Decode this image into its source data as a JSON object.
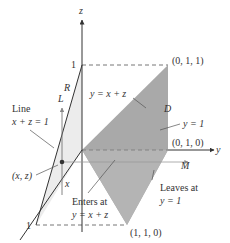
{
  "figure": {
    "type": "3d-region-diagram",
    "colors": {
      "plane_fill": "#a9a9a9",
      "face_fill": "#ececec",
      "axis": "#333333",
      "dashed": "#666666",
      "text": "#333333"
    },
    "axes": {
      "z_label": "z",
      "y_label": "y",
      "z_tick": "1",
      "x_tick": "1"
    },
    "labels": {
      "R": "R",
      "L": "L",
      "D": "D",
      "M": "M",
      "x": "x",
      "line_title": "Line",
      "line_eq": "x + z = 1",
      "plane_eq": "y = x + z",
      "y_eq_1": "y = 1",
      "point_xz": "(x, z)",
      "enters_line1": "Enters at",
      "enters_line2": "y = x + z",
      "leaves_line1": "Leaves at",
      "leaves_line2": "y = 1"
    },
    "vertices": {
      "v011": "(0, 1, 1)",
      "v010": "(0, 1, 0)",
      "v110": "(1, 1, 0)"
    }
  }
}
